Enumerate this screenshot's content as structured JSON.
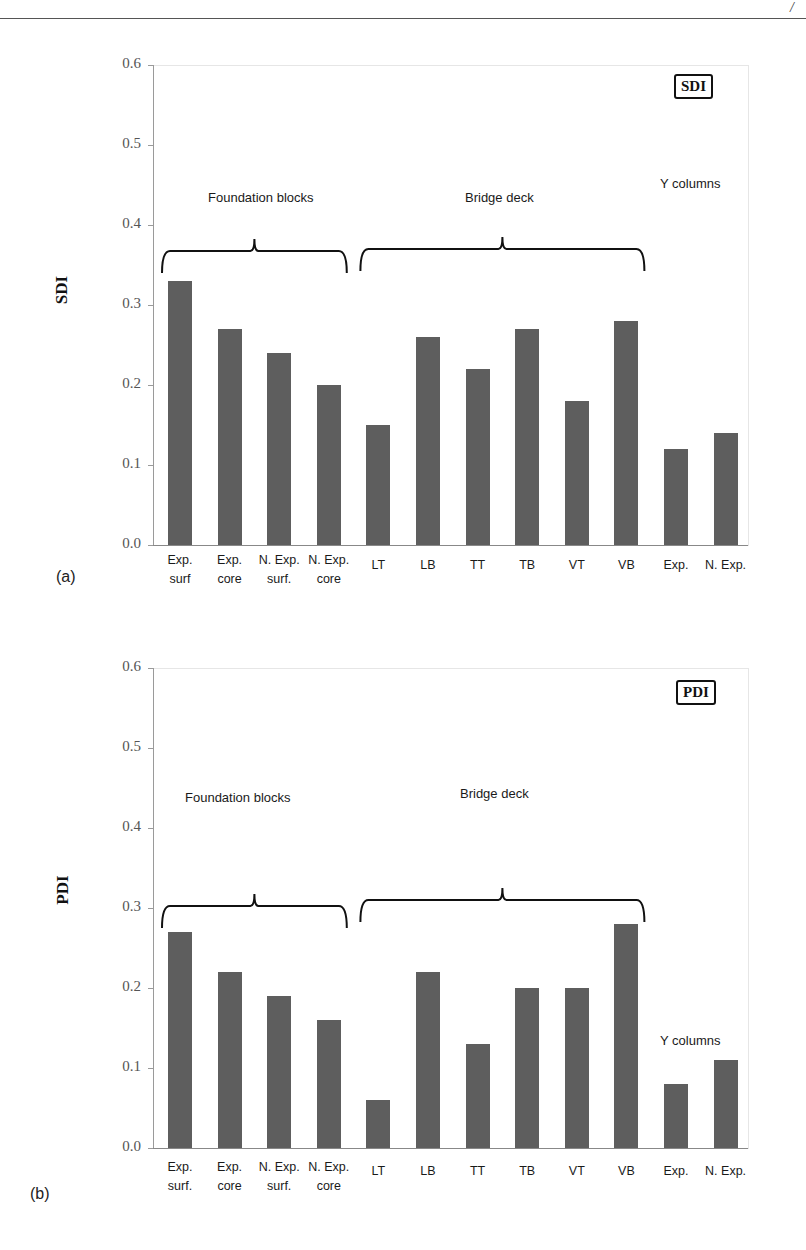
{
  "page": {
    "page_mark": "/"
  },
  "chart_data": [
    {
      "type": "bar",
      "panel_tag": "(a)",
      "title": "SDI",
      "legend_box": "SDI",
      "ylabel": "SDI",
      "xlabel": "",
      "ylim": [
        0.0,
        0.6
      ],
      "yticks": [
        "0.0",
        "0.1",
        "0.2",
        "0.3",
        "0.4",
        "0.5",
        "0.6"
      ],
      "grid": false,
      "categories": [
        "Exp. surf",
        "Exp. core",
        "N. Exp. surf.",
        "N. Exp. core",
        "LT",
        "LB",
        "TT",
        "TB",
        "VT",
        "VB",
        "Exp.",
        "N. Exp."
      ],
      "category_lines": [
        [
          "Exp.",
          "surf"
        ],
        [
          "Exp.",
          "core"
        ],
        [
          "N. Exp.",
          "surf."
        ],
        [
          "N. Exp.",
          "core"
        ],
        [
          "LT"
        ],
        [
          "LB"
        ],
        [
          "TT"
        ],
        [
          "TB"
        ],
        [
          "VT"
        ],
        [
          "VB"
        ],
        [
          "Exp."
        ],
        [
          "N. Exp."
        ]
      ],
      "values": [
        0.33,
        0.27,
        0.24,
        0.2,
        0.15,
        0.26,
        0.22,
        0.27,
        0.18,
        0.28,
        0.12,
        0.14
      ],
      "groups": [
        {
          "label": "Foundation blocks",
          "from": 0,
          "to": 3
        },
        {
          "label": "Bridge deck",
          "from": 4,
          "to": 9
        },
        {
          "label": "Y columns",
          "from": 10,
          "to": 11
        }
      ]
    },
    {
      "type": "bar",
      "panel_tag": "(b)",
      "title": "PDI",
      "legend_box": "PDI",
      "ylabel": "PDI",
      "xlabel": "",
      "ylim": [
        0.0,
        0.6
      ],
      "yticks": [
        "0.0",
        "0.1",
        "0.2",
        "0.3",
        "0.4",
        "0.5",
        "0.6"
      ],
      "grid": false,
      "categories": [
        "Exp. surf.",
        "Exp. core",
        "N. Exp. surf.",
        "N. Exp. core",
        "LT",
        "LB",
        "TT",
        "TB",
        "VT",
        "VB",
        "Exp.",
        "N. Exp."
      ],
      "category_lines": [
        [
          "Exp.",
          "surf."
        ],
        [
          "Exp.",
          "core"
        ],
        [
          "N. Exp.",
          "surf."
        ],
        [
          "N. Exp.",
          "core"
        ],
        [
          "LT"
        ],
        [
          "LB"
        ],
        [
          "TT"
        ],
        [
          "TB"
        ],
        [
          "VT"
        ],
        [
          "VB"
        ],
        [
          "Exp."
        ],
        [
          "N. Exp."
        ]
      ],
      "values": [
        0.27,
        0.22,
        0.19,
        0.16,
        0.06,
        0.22,
        0.13,
        0.2,
        0.2,
        0.28,
        0.08,
        0.11
      ],
      "groups": [
        {
          "label": "Foundation blocks",
          "from": 0,
          "to": 3
        },
        {
          "label": "Bridge deck",
          "from": 4,
          "to": 9
        },
        {
          "label": "Y columns",
          "from": 10,
          "to": 11
        }
      ]
    }
  ],
  "colors": {
    "bar": "#5e5e5e",
    "axis": "#9a9a9a",
    "text": "#1a1a1a"
  }
}
